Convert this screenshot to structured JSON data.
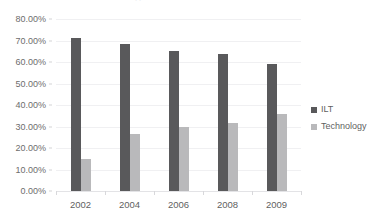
{
  "chart_data": {
    "type": "bar",
    "title": "",
    "title_remnant": "clipped title text",
    "xlabel": "",
    "ylabel": "",
    "categories": [
      "2002",
      "2004",
      "2006",
      "2008",
      "2009"
    ],
    "series": [
      {
        "name": "ILT",
        "color": "#59595b",
        "values": [
          71.0,
          68.5,
          65.0,
          63.5,
          59.0
        ]
      },
      {
        "name": "Technology",
        "color": "#b9b9bb",
        "values": [
          15.0,
          26.5,
          30.0,
          31.5,
          36.0
        ]
      }
    ],
    "ylim": [
      0,
      80
    ],
    "ytick_values": [
      0,
      10,
      20,
      30,
      40,
      50,
      60,
      70,
      80
    ],
    "ytick_labels": [
      "0.00%",
      "10.00%",
      "20.00%",
      "30.00%",
      "40.00%",
      "50.00%",
      "60.00%",
      "70.00%",
      "80.00%"
    ],
    "grid": "horizontal",
    "legend_position": "right",
    "value_format": "percent"
  },
  "legend": {
    "entries": [
      {
        "label": "ILT"
      },
      {
        "label": "Technology"
      }
    ]
  }
}
